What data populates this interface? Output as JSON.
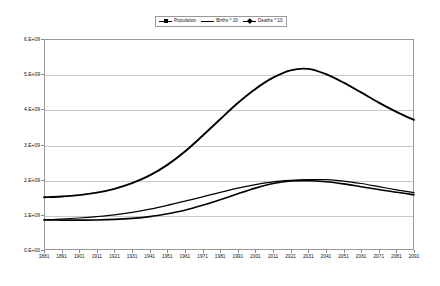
{
  "chart_data": {
    "type": "line",
    "title": "",
    "xlabel": "",
    "ylabel": "",
    "grid": true,
    "legend_position": "top-center",
    "xlim": [
      1881,
      2091
    ],
    "ylim": [
      0,
      6000000000
    ],
    "ytick_labels": [
      "0.E+00",
      "1.E+09",
      "2.E+09",
      "3.E+09",
      "4.E+09",
      "5.E+09",
      "6.E+09"
    ],
    "ytick_values": [
      0,
      1000000000,
      2000000000,
      3000000000,
      4000000000,
      5000000000,
      6000000000
    ],
    "categories": [
      1881,
      1891,
      1901,
      1911,
      1921,
      1931,
      1941,
      1951,
      1961,
      1971,
      1981,
      1991,
      2001,
      2011,
      2021,
      2031,
      2041,
      2051,
      2061,
      2071,
      2081,
      2091
    ],
    "xtick_labels": [
      "1881",
      "1891",
      "1901",
      "1911",
      "1921",
      "1931",
      "1941",
      "1951",
      "1961",
      "1971",
      "1981",
      "1991",
      "2001",
      "2011",
      "2021",
      "2031",
      "2041",
      "2051",
      "2061",
      "2071",
      "2081",
      "2091"
    ],
    "series": [
      {
        "name": "Population",
        "marker": "triangle",
        "color": "#000000",
        "values": [
          1500000000,
          1520000000,
          1560000000,
          1630000000,
          1740000000,
          1900000000,
          2120000000,
          2420000000,
          2800000000,
          3250000000,
          3720000000,
          4180000000,
          4580000000,
          4900000000,
          5110000000,
          5150000000,
          5000000000,
          4760000000,
          4480000000,
          4190000000,
          3930000000,
          3700000000
        ]
      },
      {
        "name": "Births * 10",
        "marker": "none",
        "color": "#000000",
        "values": [
          860000000,
          880000000,
          910000000,
          950000000,
          1000000000,
          1070000000,
          1160000000,
          1270000000,
          1390000000,
          1510000000,
          1640000000,
          1760000000,
          1860000000,
          1940000000,
          1980000000,
          2000000000,
          2000000000,
          1960000000,
          1890000000,
          1800000000,
          1710000000,
          1630000000
        ]
      },
      {
        "name": "Deaths * 10",
        "marker": "diamond",
        "color": "#000000",
        "values": [
          855000000,
          850000000,
          850000000,
          855000000,
          870000000,
          900000000,
          950000000,
          1030000000,
          1130000000,
          1270000000,
          1430000000,
          1600000000,
          1760000000,
          1890000000,
          1960000000,
          1970000000,
          1940000000,
          1880000000,
          1800000000,
          1720000000,
          1640000000,
          1570000000
        ]
      }
    ]
  },
  "legend": {
    "items": [
      {
        "label": "Population",
        "marker": "triangle"
      },
      {
        "label": "Births * 10",
        "marker": "none"
      },
      {
        "label": "Deaths * 10",
        "marker": "diamond"
      }
    ]
  }
}
